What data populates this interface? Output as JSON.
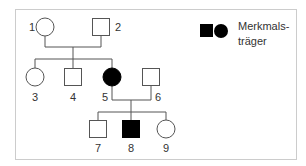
{
  "diagram": {
    "type": "pedigree",
    "legend": {
      "symbols": [
        "filled-square",
        "filled-circle"
      ],
      "line1": "Merkmals-",
      "line2": "träger"
    },
    "individuals": [
      {
        "id": "1",
        "label": "1",
        "sex": "female",
        "affected": false,
        "generation": 1
      },
      {
        "id": "2",
        "label": "2",
        "sex": "male",
        "affected": false,
        "generation": 1
      },
      {
        "id": "3",
        "label": "3",
        "sex": "female",
        "affected": false,
        "generation": 2
      },
      {
        "id": "4",
        "label": "4",
        "sex": "male",
        "affected": false,
        "generation": 2
      },
      {
        "id": "5",
        "label": "5",
        "sex": "female",
        "affected": true,
        "generation": 2
      },
      {
        "id": "6",
        "label": "6",
        "sex": "male",
        "affected": false,
        "generation": 2
      },
      {
        "id": "7",
        "label": "7",
        "sex": "male",
        "affected": false,
        "generation": 3
      },
      {
        "id": "8",
        "label": "8",
        "sex": "male",
        "affected": true,
        "generation": 3
      },
      {
        "id": "9",
        "label": "9",
        "sex": "female",
        "affected": false,
        "generation": 3
      }
    ],
    "matings": [
      {
        "partners": [
          "1",
          "2"
        ],
        "children": [
          "3",
          "4",
          "5"
        ]
      },
      {
        "partners": [
          "5",
          "6"
        ],
        "children": [
          "7",
          "8",
          "9"
        ]
      }
    ],
    "colors": {
      "line": "#555555",
      "affected_fill": "#000000",
      "border": "#cccccc"
    }
  }
}
